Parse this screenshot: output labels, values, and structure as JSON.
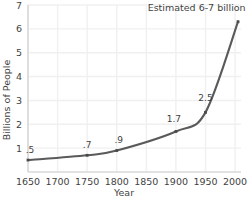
{
  "chart_data": {
    "type": "line",
    "title": "",
    "xlabel": "Year",
    "ylabel": "Billions of People",
    "xlim": [
      1650,
      2010
    ],
    "ylim": [
      0,
      7
    ],
    "grid": true,
    "legend_position": "none",
    "x_ticks": [
      "1650",
      "1700",
      "1750",
      "1800",
      "1850",
      "1900",
      "1950",
      "2000"
    ],
    "x_tick_values": [
      1650,
      1700,
      1750,
      1800,
      1850,
      1900,
      1950,
      2000
    ],
    "y_ticks": [
      "1",
      "2",
      "3",
      "4",
      "5",
      "6",
      "7"
    ],
    "y_tick_values": [
      1,
      2,
      3,
      4,
      5,
      6,
      7
    ],
    "x": [
      1650,
      1750,
      1800,
      1900,
      1950,
      2005
    ],
    "values": [
      0.5,
      0.7,
      0.9,
      1.7,
      2.5,
      6.3
    ],
    "point_labels": [
      ".5",
      ".7",
      ".9",
      "1.7",
      "2.5",
      ""
    ],
    "series": [
      {
        "name": "World Population",
        "x": [
          1650,
          1750,
          1800,
          1900,
          1950,
          2005
        ],
        "values": [
          0.5,
          0.7,
          0.9,
          1.7,
          2.5,
          6.3
        ],
        "color": "#5a5a5a"
      }
    ],
    "annotations": [
      {
        "text": "Estimated 6-7 billion",
        "x": 1935,
        "y": 6.75
      }
    ],
    "colors": {
      "line": "#5a5a5a",
      "marker": "#4a4a4a",
      "grid": "#f0f0f0",
      "axis": "#d9d9d9",
      "text": "#3f3f3f",
      "background": "#ffffff"
    }
  }
}
